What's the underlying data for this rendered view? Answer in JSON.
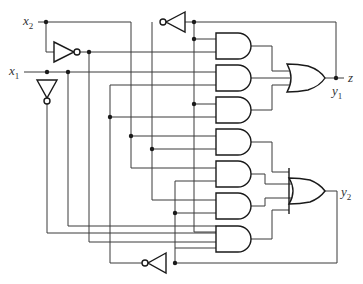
{
  "diagram": {
    "type": "sequential logic circuit",
    "inputs": [
      {
        "id": "x2",
        "label": "x",
        "sub": "2"
      },
      {
        "id": "x1",
        "label": "x",
        "sub": "1"
      }
    ],
    "outputs": [
      {
        "id": "z",
        "label": "z"
      },
      {
        "id": "y1",
        "label": "y",
        "sub": "1"
      },
      {
        "id": "y2",
        "label": "y",
        "sub": "2"
      }
    ],
    "gates": {
      "inverters": 4,
      "and_gates": 7,
      "or_gates": 2
    },
    "colors": {
      "wire": "#3a3a3a",
      "gate_stroke": "#1a1a1a",
      "background": "#ffffff"
    }
  }
}
